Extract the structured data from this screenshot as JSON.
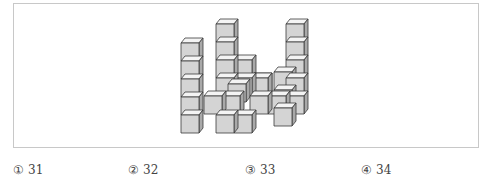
{
  "figure": {
    "colors": {
      "front": "#d4d4d4",
      "top": "#f4f4f4",
      "side": "#a9a9a9",
      "edge": "#3a3a3a"
    },
    "cube": {
      "w": 18,
      "h": 18,
      "dx": 4,
      "dy": 5
    },
    "cubes": [
      {
        "x": 216,
        "y": 24
      },
      {
        "x": 216,
        "y": 42
      },
      {
        "x": 216,
        "y": 60
      },
      {
        "x": 216,
        "y": 78
      },
      {
        "x": 286,
        "y": 24
      },
      {
        "x": 286,
        "y": 42
      },
      {
        "x": 286,
        "y": 60
      },
      {
        "x": 286,
        "y": 78
      },
      {
        "x": 286,
        "y": 96
      },
      {
        "x": 234,
        "y": 60
      },
      {
        "x": 234,
        "y": 78
      },
      {
        "x": 204,
        "y": 96
      },
      {
        "x": 222,
        "y": 96
      },
      {
        "x": 250,
        "y": 78
      },
      {
        "x": 250,
        "y": 96
      },
      {
        "x": 268,
        "y": 96
      },
      {
        "x": 181,
        "y": 43
      },
      {
        "x": 181,
        "y": 61
      },
      {
        "x": 181,
        "y": 79
      },
      {
        "x": 181,
        "y": 97
      },
      {
        "x": 181,
        "y": 115
      },
      {
        "x": 228,
        "y": 84
      },
      {
        "x": 250,
        "y": 78
      },
      {
        "x": 274,
        "y": 72
      },
      {
        "x": 274,
        "y": 90
      },
      {
        "x": 274,
        "y": 108
      },
      {
        "x": 216,
        "y": 115
      },
      {
        "x": 234,
        "y": 115
      }
    ]
  },
  "options": [
    {
      "mark": "①",
      "value": "31"
    },
    {
      "mark": "②",
      "value": "32"
    },
    {
      "mark": "③",
      "value": "33"
    },
    {
      "mark": "④",
      "value": "34"
    }
  ]
}
